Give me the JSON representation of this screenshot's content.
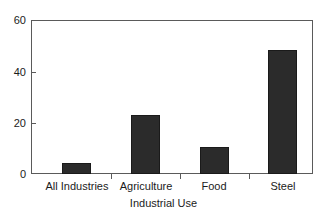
{
  "chart_data": {
    "type": "bar",
    "title": "",
    "subtitle": "",
    "xlabel": "Industrial Use",
    "ylabel": "",
    "categories": [
      "All Industries",
      "Agriculture",
      "Food",
      "Steel"
    ],
    "values": [
      4.3,
      23.3,
      10.5,
      48.5
    ],
    "series": [
      {
        "name": "Industrial Use",
        "values": [
          4.3,
          23.3,
          10.5,
          48.5
        ]
      }
    ],
    "ylim": [
      0,
      60
    ],
    "yticks": [
      0,
      20,
      40,
      60
    ],
    "ytick_labels": [
      "0",
      "20",
      "40",
      "60"
    ],
    "grid": false,
    "legend": false,
    "legend_position": "none",
    "bar_color": "#2b2b2b",
    "bar_edge_color": "#1a1a1a",
    "axis_color": "#5a5a5a",
    "background_color": "#ffffff",
    "text_color": "#1b1b1b"
  }
}
